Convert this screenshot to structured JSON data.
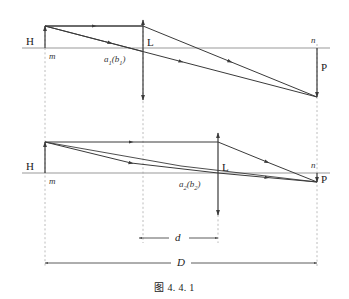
{
  "figure": {
    "caption": "图 4. 4. 1",
    "colors": {
      "ray": "#3a3a3a",
      "axis": "#9a9a9a",
      "dashed_guide": "#b4b4b4",
      "dimension": "#4a4a4a",
      "text": "#1a1a1a"
    }
  },
  "labels": {
    "upper": {
      "object_H": "H",
      "axis_left_m": "m",
      "lens_L": "L",
      "focal_point": "a₁(b₁)",
      "focal_point_base": "a",
      "focal_point_sub1": "1",
      "focal_point_paren_base": "b",
      "focal_point_sub2": "1",
      "axis_right_n": "n",
      "image_P": "P"
    },
    "lower": {
      "object_H": "H",
      "axis_left_m": "m",
      "lens_L": "L",
      "focal_point": "a₂(b₂)",
      "focal_point_base": "a",
      "focal_point_sub1": "2",
      "focal_point_paren_base": "b",
      "focal_point_sub2": "2",
      "axis_right_n": "n",
      "image_P": "P"
    },
    "dimensions": {
      "d": "d",
      "D": "D"
    }
  },
  "geometry": {
    "upper": {
      "axis_y": 48,
      "object_x": 45,
      "object_top_y": 26,
      "lens_x": 143,
      "lens_top_y": 20,
      "lens_bottom_y": 100,
      "image_x": 317,
      "image_bottom_y": 97
    },
    "lower": {
      "axis_y": 173,
      "object_x": 45,
      "object_top_y": 142,
      "lens_x": 218,
      "lens_top_y": 133,
      "lens_bottom_y": 215,
      "image_x": 317,
      "image_bottom_y": 182
    },
    "dimension_d": {
      "x1": 139,
      "x2": 218,
      "y": 238
    },
    "dimension_D": {
      "x1": 45,
      "x2": 317,
      "y": 263
    }
  }
}
